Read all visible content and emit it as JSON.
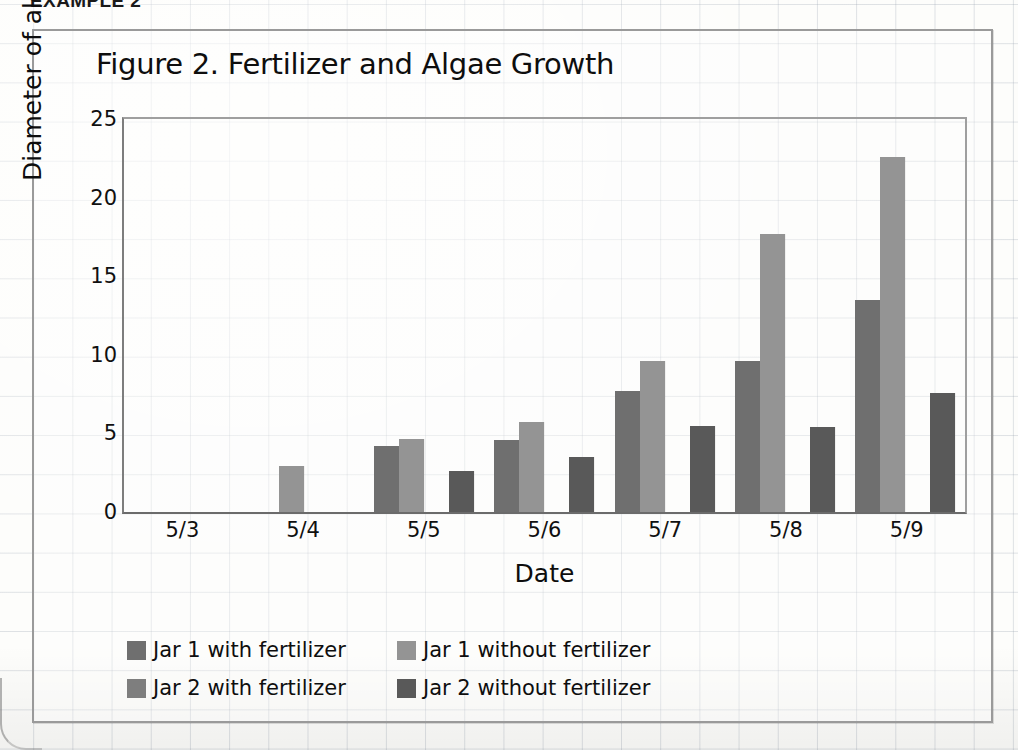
{
  "heading": "EXAMPLE 2",
  "chart_data": {
    "type": "bar",
    "title": "Figure 2. Fertilizer and Algae Growth",
    "xlabel": "Date",
    "ylabel": "Diameter of algae (mm)",
    "categories": [
      "5/3",
      "5/4",
      "5/5",
      "5/6",
      "5/7",
      "5/8",
      "5/9"
    ],
    "ylim": [
      0,
      25
    ],
    "yticks": [
      0,
      5,
      10,
      15,
      20,
      25
    ],
    "grid": true,
    "legend_position": "bottom-left",
    "series": [
      {
        "name": "Jar 1 with fertilizer",
        "color": "#6f6f6f",
        "values": [
          0,
          0,
          4.2,
          4.6,
          7.7,
          9.6,
          13.5
        ]
      },
      {
        "name": "Jar 1 without fertilizer",
        "color": "#949494",
        "values": [
          0,
          2.9,
          4.65,
          5.7,
          9.6,
          17.7,
          22.6
        ]
      },
      {
        "name": "Jar 2 with fertilizer",
        "color": "#7e7e7e",
        "values": [
          0,
          0,
          0,
          0,
          0,
          0,
          0
        ]
      },
      {
        "name": "Jar 2 without fertilizer",
        "color": "#595959",
        "values": [
          0,
          0,
          2.6,
          3.5,
          5.5,
          5.4,
          7.6
        ]
      }
    ]
  }
}
